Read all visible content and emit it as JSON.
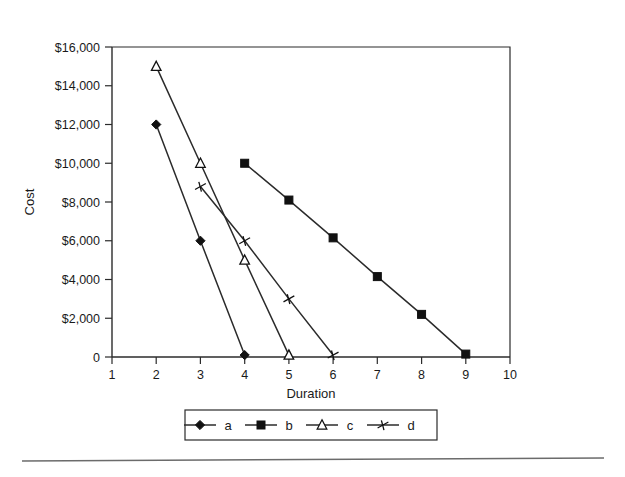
{
  "chart_data": {
    "type": "line",
    "title": "",
    "xlabel": "Duration",
    "ylabel": "Cost",
    "xlim": [
      1,
      10
    ],
    "ylim": [
      0,
      16000
    ],
    "grid": false,
    "legend_position": "bottom",
    "x_tick_labels": [
      "1",
      "2",
      "3",
      "4",
      "5",
      "6",
      "7",
      "8",
      "9",
      "10"
    ],
    "x_ticks": [
      1,
      2,
      3,
      4,
      5,
      6,
      7,
      8,
      9,
      10
    ],
    "y_tick_labels": [
      "0",
      "$2,000",
      "$4,000",
      "$6,000",
      "$8,000",
      "$10,000",
      "$12,000",
      "$14,000",
      "$16,000"
    ],
    "y_ticks": [
      0,
      2000,
      4000,
      6000,
      8000,
      10000,
      12000,
      14000,
      16000
    ],
    "series": [
      {
        "name": "a",
        "marker": "filled-diamond",
        "x": [
          2,
          3,
          4
        ],
        "y": [
          12000,
          6000,
          100
        ]
      },
      {
        "name": "b",
        "marker": "filled-square",
        "x": [
          4,
          5,
          6,
          7,
          8,
          9
        ],
        "y": [
          10000,
          8100,
          6150,
          4150,
          2200,
          150
        ]
      },
      {
        "name": "c",
        "marker": "open-triangle",
        "x": [
          2,
          3,
          4,
          5
        ],
        "y": [
          15000,
          10000,
          5000,
          100
        ]
      },
      {
        "name": "d",
        "marker": "cross",
        "x": [
          3,
          4,
          5,
          6
        ],
        "y": [
          8800,
          6000,
          3000,
          100
        ]
      }
    ]
  },
  "axes": {
    "y_title": "Cost",
    "x_title": "Duration"
  },
  "legend": {
    "entries": [
      {
        "label": "a",
        "marker": "filled-diamond"
      },
      {
        "label": "b",
        "marker": "filled-square"
      },
      {
        "label": "c",
        "marker": "open-triangle"
      },
      {
        "label": "d",
        "marker": "cross"
      }
    ]
  },
  "colors": {
    "ink": "#2b2b2b",
    "marker_fill": "#111111",
    "marker_open_fill": "#ffffff",
    "background": "#ffffff",
    "footer_rule": "#6b6b6b"
  }
}
